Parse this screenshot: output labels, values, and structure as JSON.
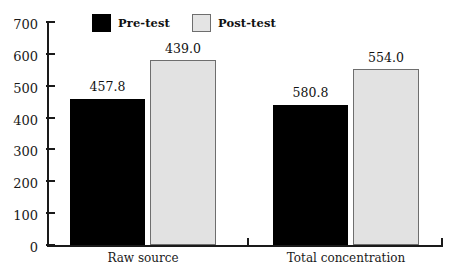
{
  "chart_data": {
    "type": "bar",
    "title": "",
    "subtitle": "",
    "xlabel": "",
    "ylabel": "",
    "categories": [
      "Raw source",
      "Total concentration"
    ],
    "series": [
      {
        "name": "Pre-test",
        "values": [
          457.8,
          439.0
        ],
        "color": "#000000"
      },
      {
        "name": "Post-test",
        "values": [
          580.8,
          554.0
        ],
        "color": "#e2e2e2"
      }
    ],
    "value_labels": [
      [
        "457.8",
        "580.8"
      ],
      [
        "439.0",
        "554.0"
      ]
    ],
    "ylim": [
      0,
      700
    ],
    "ytick_values": [
      700,
      600,
      500,
      400,
      300,
      200,
      100,
      0
    ],
    "ytick_labels": [
      "700",
      "600",
      "500",
      "400",
      "300",
      "200",
      "100",
      "0"
    ],
    "ystep": 100,
    "grid": false,
    "legend_position": "top-center",
    "legend": [
      {
        "label": "Pre-test",
        "swatch": "black-square"
      },
      {
        "label": "Post-test",
        "swatch": "light-gray-square"
      }
    ]
  },
  "colors": {
    "pre_test": "#000000",
    "post_test": "#e2e2e2",
    "post_test_border": "#6e6e6e",
    "axis": "#1a1a1a",
    "background": "#ffffff",
    "text": "#111111"
  }
}
